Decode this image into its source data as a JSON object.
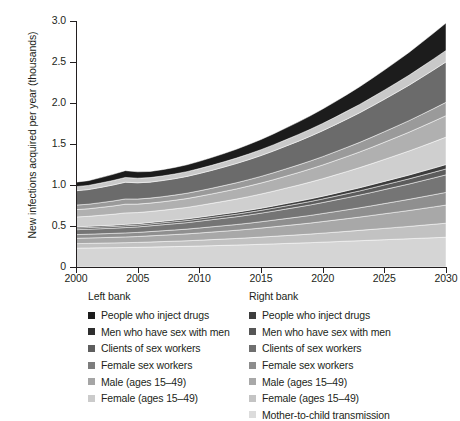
{
  "chart_data": {
    "type": "area",
    "stacked": true,
    "title": "",
    "xlabel": "",
    "ylabel": "New infections acquired per year (thousands)",
    "xlim": [
      2000,
      2030
    ],
    "ylim": [
      0,
      3.0
    ],
    "yticks": [
      "0",
      "0.5",
      "1.0",
      "1.5",
      "2.0",
      "2.5",
      "3.0"
    ],
    "ytick_values": [
      0,
      0.5,
      1.0,
      1.5,
      2.0,
      2.5,
      3.0
    ],
    "xticks": [
      "2000",
      "2005",
      "2010",
      "2015",
      "2020",
      "2025",
      "2030"
    ],
    "xtick_values": [
      2000,
      2005,
      2010,
      2015,
      2020,
      2025,
      2030
    ],
    "grid": false,
    "legend_position": "below",
    "x": [
      2000,
      2001,
      2002,
      2003,
      2004,
      2005,
      2006,
      2007,
      2008,
      2009,
      2010,
      2011,
      2012,
      2013,
      2014,
      2015,
      2016,
      2017,
      2018,
      2019,
      2020,
      2021,
      2022,
      2023,
      2024,
      2025,
      2026,
      2027,
      2028,
      2029,
      2030
    ],
    "series": [
      {
        "name": "Mother-to-child transmission",
        "bank": "Right bank",
        "color": "#d5d5d5",
        "values": [
          0.23,
          0.232,
          0.234,
          0.236,
          0.238,
          0.24,
          0.243,
          0.246,
          0.249,
          0.252,
          0.256,
          0.26,
          0.264,
          0.268,
          0.272,
          0.277,
          0.282,
          0.287,
          0.292,
          0.297,
          0.303,
          0.309,
          0.315,
          0.321,
          0.327,
          0.333,
          0.339,
          0.345,
          0.351,
          0.357,
          0.363
        ]
      },
      {
        "name": "Female (ages 15-49)",
        "bank": "Right bank",
        "color": "#c2c2c2",
        "values": [
          0.055,
          0.056,
          0.057,
          0.058,
          0.059,
          0.06,
          0.062,
          0.064,
          0.066,
          0.068,
          0.071,
          0.074,
          0.077,
          0.08,
          0.084,
          0.088,
          0.092,
          0.096,
          0.1,
          0.105,
          0.11,
          0.115,
          0.12,
          0.126,
          0.132,
          0.138,
          0.144,
          0.15,
          0.157,
          0.164,
          0.171
        ]
      },
      {
        "name": "Male (ages 15-49)",
        "bank": "Right bank",
        "color": "#a8a8a8",
        "values": [
          0.065,
          0.066,
          0.067,
          0.068,
          0.07,
          0.072,
          0.075,
          0.078,
          0.081,
          0.084,
          0.088,
          0.092,
          0.096,
          0.1,
          0.105,
          0.11,
          0.116,
          0.122,
          0.128,
          0.134,
          0.141,
          0.148,
          0.155,
          0.162,
          0.17,
          0.178,
          0.186,
          0.194,
          0.203,
          0.212,
          0.221
        ]
      },
      {
        "name": "Female sex workers",
        "bank": "Right bank",
        "color": "#8f8f8f",
        "values": [
          0.045,
          0.046,
          0.047,
          0.048,
          0.049,
          0.05,
          0.052,
          0.054,
          0.056,
          0.058,
          0.061,
          0.064,
          0.067,
          0.07,
          0.073,
          0.077,
          0.081,
          0.085,
          0.089,
          0.093,
          0.098,
          0.103,
          0.108,
          0.113,
          0.118,
          0.124,
          0.13,
          0.136,
          0.142,
          0.148,
          0.155
        ]
      },
      {
        "name": "Clients of sex workers",
        "bank": "Right bank",
        "color": "#757575",
        "values": [
          0.06,
          0.061,
          0.062,
          0.063,
          0.065,
          0.067,
          0.07,
          0.073,
          0.076,
          0.079,
          0.083,
          0.087,
          0.091,
          0.095,
          0.1,
          0.105,
          0.11,
          0.116,
          0.122,
          0.128,
          0.134,
          0.141,
          0.148,
          0.155,
          0.163,
          0.171,
          0.179,
          0.187,
          0.196,
          0.205,
          0.214
        ]
      },
      {
        "name": "Men who have sex with men",
        "bank": "Right bank",
        "color": "#5c5c5c",
        "values": [
          0.02,
          0.02,
          0.021,
          0.021,
          0.022,
          0.022,
          0.023,
          0.024,
          0.025,
          0.026,
          0.027,
          0.028,
          0.03,
          0.031,
          0.033,
          0.034,
          0.036,
          0.038,
          0.04,
          0.042,
          0.044,
          0.046,
          0.049,
          0.051,
          0.054,
          0.057,
          0.06,
          0.063,
          0.066,
          0.069,
          0.072
        ]
      },
      {
        "name": "People who inject drugs",
        "bank": "Right bank",
        "color": "#3d3d3d",
        "values": [
          0.015,
          0.015,
          0.016,
          0.016,
          0.017,
          0.017,
          0.018,
          0.018,
          0.019,
          0.02,
          0.021,
          0.022,
          0.023,
          0.024,
          0.025,
          0.026,
          0.027,
          0.029,
          0.03,
          0.032,
          0.033,
          0.035,
          0.037,
          0.039,
          0.041,
          0.043,
          0.045,
          0.047,
          0.049,
          0.051,
          0.054
        ]
      },
      {
        "name": "Female (ages 15-49)",
        "bank": "Left bank",
        "color": "#cfcfcf",
        "values": [
          0.12,
          0.122,
          0.127,
          0.133,
          0.14,
          0.136,
          0.134,
          0.135,
          0.137,
          0.14,
          0.144,
          0.149,
          0.154,
          0.16,
          0.166,
          0.173,
          0.18,
          0.188,
          0.196,
          0.205,
          0.214,
          0.224,
          0.234,
          0.245,
          0.256,
          0.268,
          0.28,
          0.293,
          0.306,
          0.32,
          0.334
        ]
      },
      {
        "name": "Male (ages 15-49)",
        "bank": "Left bank",
        "color": "#b0b0b0",
        "values": [
          0.09,
          0.092,
          0.096,
          0.101,
          0.106,
          0.103,
          0.102,
          0.103,
          0.105,
          0.108,
          0.111,
          0.115,
          0.119,
          0.124,
          0.129,
          0.134,
          0.14,
          0.146,
          0.153,
          0.16,
          0.167,
          0.175,
          0.183,
          0.191,
          0.2,
          0.209,
          0.219,
          0.229,
          0.24,
          0.251,
          0.262
        ]
      },
      {
        "name": "Female sex workers",
        "bank": "Left bank",
        "color": "#9a9a9a",
        "values": [
          0.055,
          0.056,
          0.058,
          0.061,
          0.064,
          0.062,
          0.061,
          0.062,
          0.063,
          0.065,
          0.067,
          0.069,
          0.072,
          0.075,
          0.078,
          0.081,
          0.085,
          0.089,
          0.093,
          0.097,
          0.102,
          0.107,
          0.112,
          0.117,
          0.123,
          0.129,
          0.135,
          0.141,
          0.148,
          0.155,
          0.162
        ]
      },
      {
        "name": "Clients of sex workers",
        "bank": "Left bank",
        "color": "#6b6b6b",
        "values": [
          0.175,
          0.178,
          0.186,
          0.195,
          0.204,
          0.198,
          0.195,
          0.197,
          0.2,
          0.205,
          0.211,
          0.218,
          0.226,
          0.235,
          0.244,
          0.254,
          0.265,
          0.277,
          0.289,
          0.302,
          0.316,
          0.33,
          0.345,
          0.361,
          0.378,
          0.395,
          0.413,
          0.432,
          0.452,
          0.472,
          0.493
        ]
      },
      {
        "name": "Men who have sex with men",
        "bank": "Left bank",
        "color": "#c9c9c9",
        "values": [
          0.05,
          0.051,
          0.053,
          0.055,
          0.058,
          0.056,
          0.055,
          0.056,
          0.057,
          0.058,
          0.06,
          0.062,
          0.064,
          0.066,
          0.069,
          0.072,
          0.075,
          0.078,
          0.082,
          0.085,
          0.089,
          0.093,
          0.098,
          0.102,
          0.107,
          0.112,
          0.117,
          0.122,
          0.128,
          0.134,
          0.14
        ]
      },
      {
        "name": "People who inject drugs",
        "bank": "Left bank",
        "color": "#1c1c1c",
        "values": [
          0.055,
          0.058,
          0.066,
          0.075,
          0.083,
          0.078,
          0.075,
          0.077,
          0.08,
          0.084,
          0.089,
          0.095,
          0.101,
          0.108,
          0.116,
          0.124,
          0.133,
          0.143,
          0.153,
          0.164,
          0.176,
          0.188,
          0.201,
          0.215,
          0.23,
          0.245,
          0.261,
          0.278,
          0.296,
          0.315,
          0.335
        ]
      }
    ]
  },
  "axes": {
    "y_title": "New infections acquired per year (thousands)"
  },
  "legend": {
    "left": {
      "title": "Left bank",
      "items": [
        {
          "label": "People who inject drugs",
          "color": "#1c1c1c"
        },
        {
          "label": "Men who have sex with men",
          "color": "#2e2e2e"
        },
        {
          "label": "Clients of sex workers",
          "color": "#5e5e5e"
        },
        {
          "label": "Female sex workers",
          "color": "#7d7d7d"
        },
        {
          "label": "Male (ages 15–49)",
          "color": "#a5a5a5"
        },
        {
          "label": "Female (ages 15–49)",
          "color": "#cbcbcb"
        }
      ]
    },
    "right": {
      "title": "Right bank",
      "items": [
        {
          "label": "People who inject drugs",
          "color": "#3d3d3d"
        },
        {
          "label": "Men who have sex with men",
          "color": "#565656"
        },
        {
          "label": "Clients of sex workers",
          "color": "#6f6f6f"
        },
        {
          "label": "Female sex workers",
          "color": "#8d8d8d"
        },
        {
          "label": "Male (ages 15–49)",
          "color": "#a8a8a8"
        },
        {
          "label": "Female (ages 15–49)",
          "color": "#c4c4c4"
        },
        {
          "label": "Mother-to-child transmission",
          "color": "#dcdcdc"
        }
      ]
    }
  }
}
